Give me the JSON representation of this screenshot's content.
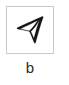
{
  "figure": {
    "panel_label": "b",
    "glyph": {
      "icon_name": "navigation-arrow-icon",
      "description": "hand-drawn navigation / cursor arrow pointing up-right",
      "stroke_color": "#151515"
    },
    "box": {
      "border_color": "#c9c9c9",
      "background_color": "#ffffff",
      "width_px": 48,
      "height_px": 48
    },
    "canvas": {
      "background_color": "#ffffff",
      "width_px": 69,
      "height_px": 85
    }
  }
}
